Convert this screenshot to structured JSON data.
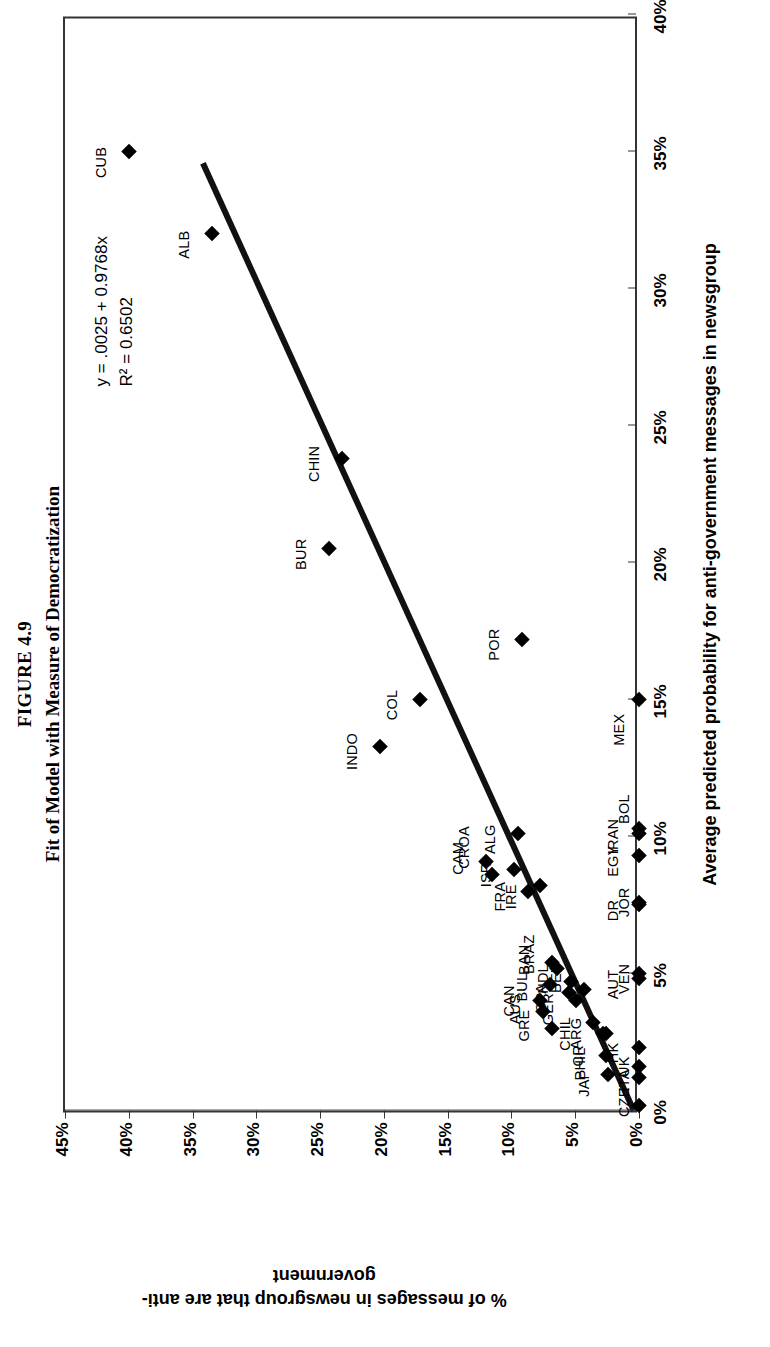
{
  "figure": {
    "number": "FIGURE 4.9",
    "caption": "Fit of Model with Measure of Democratization"
  },
  "annotation": {
    "equation": "y = .0025 + 0.9768x",
    "r_squared": "R² = 0.6502"
  },
  "chart_data": {
    "type": "scatter",
    "title": "Fit of Model with Measure of Democratization",
    "xlabel": "Average predicted probability for anti-government messages in newsgroup",
    "ylabel": "% of messages in newsgroup that are anti-government",
    "xlim": [
      0,
      0.4
    ],
    "ylim": [
      0,
      0.45
    ],
    "xticks": [
      "0%",
      "5%",
      "10%",
      "15%",
      "20%",
      "25%",
      "30%",
      "35%",
      "40%"
    ],
    "xtick_values": [
      0,
      0.05,
      0.1,
      0.15,
      0.2,
      0.25,
      0.3,
      0.35,
      0.4
    ],
    "yticks": [
      "0%",
      "5%",
      "10%",
      "15%",
      "20%",
      "25%",
      "30%",
      "35%",
      "40%",
      "45%"
    ],
    "ytick_values": [
      0,
      0.05,
      0.1,
      0.15,
      0.2,
      0.25,
      0.3,
      0.35,
      0.4,
      0.45
    ],
    "grid": false,
    "legend": false,
    "trendline": {
      "equation": "y = .0025 + 0.9768x",
      "r_squared": 0.6502,
      "intercept": 0.0025,
      "slope": 0.9768,
      "x_start": 0.0,
      "x_end": 0.347
    },
    "points": [
      {
        "label": "CUB",
        "x": 0.35,
        "y": 0.4,
        "lx": -0.004,
        "ly": 0.022
      },
      {
        "label": "ALB",
        "x": 0.32,
        "y": 0.335,
        "lx": -0.004,
        "ly": 0.022
      },
      {
        "label": "CHIN",
        "x": 0.238,
        "y": 0.233,
        "lx": -0.002,
        "ly": 0.022
      },
      {
        "label": "BUR",
        "x": 0.205,
        "y": 0.243,
        "lx": -0.002,
        "ly": 0.022
      },
      {
        "label": "INDO",
        "x": 0.133,
        "y": 0.203,
        "lx": -0.002,
        "ly": 0.022
      },
      {
        "label": "COL",
        "x": 0.15,
        "y": 0.172,
        "lx": -0.002,
        "ly": 0.022
      },
      {
        "label": "POR",
        "x": 0.172,
        "y": 0.092,
        "lx": -0.002,
        "ly": 0.022
      },
      {
        "label": "MEX",
        "x": 0.15,
        "y": 0.0,
        "lx": -0.011,
        "ly": 0.016
      },
      {
        "label": "ALG",
        "x": 0.101,
        "y": 0.095,
        "lx": -0.002,
        "ly": 0.022
      },
      {
        "label": "CAM",
        "x": 0.091,
        "y": 0.12,
        "lx": 0.001,
        "ly": 0.022
      },
      {
        "label": "CROA",
        "x": 0.086,
        "y": 0.115,
        "lx": 0.01,
        "ly": 0.022
      },
      {
        "label": "ISR",
        "x": 0.088,
        "y": 0.098,
        "lx": -0.002,
        "ly": 0.022
      },
      {
        "label": "FRA",
        "x": 0.08,
        "y": 0.087,
        "lx": -0.002,
        "ly": 0.022
      },
      {
        "label": "IRE",
        "x": 0.082,
        "y": 0.078,
        "lx": -0.004,
        "ly": 0.022
      },
      {
        "label": "CAN",
        "x": 0.04,
        "y": 0.078,
        "lx": 0.0,
        "ly": 0.024
      },
      {
        "label": "AUS",
        "x": 0.036,
        "y": 0.075,
        "lx": 0.001,
        "ly": 0.022
      },
      {
        "label": "GRE",
        "x": 0.03,
        "y": 0.068,
        "lx": 0.001,
        "ly": 0.022
      },
      {
        "label": "BUL",
        "x": 0.046,
        "y": 0.07,
        "lx": -0.001,
        "ly": 0.022
      },
      {
        "label": "BAN",
        "x": 0.054,
        "y": 0.068,
        "lx": 0.001,
        "ly": 0.022
      },
      {
        "label": "BRAZ",
        "x": 0.052,
        "y": 0.064,
        "lx": 0.005,
        "ly": 0.022
      },
      {
        "label": "SPA",
        "x": 0.043,
        "y": 0.055,
        "lx": -0.002,
        "ly": 0.022
      },
      {
        "label": "NDL",
        "x": 0.047,
        "y": 0.053,
        "lx": 0.001,
        "ly": 0.022
      },
      {
        "label": "GER",
        "x": 0.04,
        "y": 0.049,
        "lx": -0.003,
        "ly": 0.022
      },
      {
        "label": "BEL",
        "x": 0.044,
        "y": 0.043,
        "lx": 0.004,
        "ly": 0.022
      },
      {
        "label": "CHIL",
        "x": 0.032,
        "y": 0.036,
        "lx": -0.004,
        "ly": 0.022
      },
      {
        "label": "CR",
        "x": 0.028,
        "y": 0.026,
        "lx": -0.008,
        "ly": 0.022
      },
      {
        "label": "ARG",
        "x": 0.028,
        "y": 0.028,
        "lx": 0.0,
        "ly": 0.021
      },
      {
        "label": "PHIL",
        "x": 0.02,
        "y": 0.026,
        "lx": -0.003,
        "ly": 0.02
      },
      {
        "label": "JAP",
        "x": 0.013,
        "y": 0.024,
        "lx": -0.003,
        "ly": 0.019
      },
      {
        "label": "HK",
        "x": 0.023,
        "y": 0.0,
        "lx": -0.002,
        "ly": 0.02
      },
      {
        "label": "AUT",
        "x": 0.05,
        "y": 0.0,
        "lx": -0.004,
        "ly": 0.02
      },
      {
        "label": "VEN",
        "x": 0.048,
        "y": 0.0,
        "lx": 0.0,
        "ly": 0.012
      },
      {
        "label": "UK",
        "x": 0.016,
        "y": 0.0,
        "lx": 0.0,
        "ly": 0.012
      },
      {
        "label": "ITA",
        "x": 0.012,
        "y": 0.0,
        "lx": -0.001,
        "ly": 0.012
      },
      {
        "label": "CZE",
        "x": 0.002,
        "y": 0.0,
        "lx": 0.001,
        "ly": 0.012
      },
      {
        "label": "JOR",
        "x": 0.075,
        "y": 0.0,
        "lx": 0.001,
        "ly": 0.012
      },
      {
        "label": "DR",
        "x": 0.076,
        "y": 0.0,
        "lx": -0.003,
        "ly": 0.02
      },
      {
        "label": "EGY",
        "x": 0.093,
        "y": 0.0,
        "lx": -0.002,
        "ly": 0.02
      },
      {
        "label": "IRAN",
        "x": 0.101,
        "y": 0.0,
        "lx": -0.001,
        "ly": 0.02
      },
      {
        "label": "BOL",
        "x": 0.103,
        "y": 0.0,
        "lx": 0.007,
        "ly": 0.012
      }
    ]
  }
}
